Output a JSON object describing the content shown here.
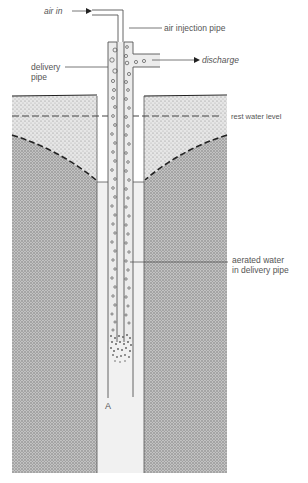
{
  "diagram": {
    "labels": {
      "air_in": "air in",
      "air_injection_pipe": "air injection pipe",
      "delivery_pipe_line1": "delivery",
      "delivery_pipe_line2": "pipe",
      "discharge": "discharge",
      "rest_water_level": "rest water level",
      "aerated_water_line1": "aerated water",
      "aerated_water_line2": "in delivery pipe",
      "point_a": "A"
    },
    "colors": {
      "line": "#555555",
      "dark_line": "#222222",
      "light_soil": "#d9d9d9",
      "dark_soil": "#b3b3b3",
      "well_water": "#f1f1f1"
    }
  }
}
